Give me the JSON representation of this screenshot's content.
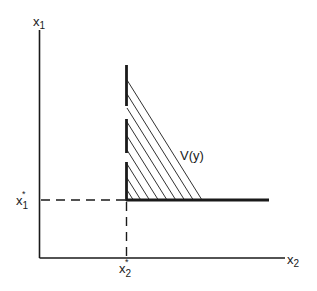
{
  "diagram": {
    "axes": {
      "y_label": "x",
      "y_label_sub": "1",
      "x_label": "x",
      "x_label_sub": "2"
    },
    "markers": {
      "x1_star_label": "x",
      "x1_star_sub": "1",
      "x1_star_sup": "*",
      "x2_star_label": "x",
      "x2_star_sub": "2",
      "x2_star_sup": "*"
    },
    "region_label": "V(y)",
    "colors": {
      "ink": "#1a1a1a",
      "background": "#ffffff"
    },
    "hatch_count": 9
  }
}
